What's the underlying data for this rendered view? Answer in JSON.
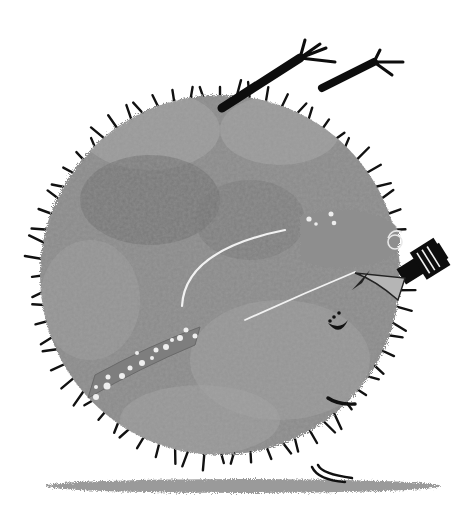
{
  "illustration": {
    "subject": "round fuzzy grey creature curled upside down with feet in the air, holding a small camera",
    "palette": {
      "background": "#ffffff",
      "body": "#8a8a8a",
      "body_light": "#a8a8a8",
      "body_dark": "#6e6e6e",
      "spikes": "#111111",
      "shadow": "#9a9a9a",
      "accent_white": "#f2f2f2",
      "camera": "#0d0d0d"
    },
    "elements": {
      "body": "fuzzy circle",
      "legs": 2,
      "scarf": "polka-dot band",
      "camera": "black camera with striped lens",
      "eye": "closed eye",
      "smile": "smile with dots",
      "ear": "triangular ear",
      "ground_shadow": "flat elliptical shadow"
    }
  }
}
